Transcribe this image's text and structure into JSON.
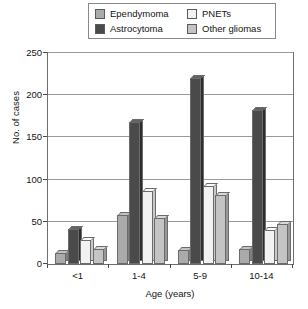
{
  "chart_data": {
    "type": "bar",
    "title": "",
    "subtitle": "",
    "xlabel": "Age (years)",
    "ylabel": "No. of cases",
    "categories": [
      "<1",
      "1-4",
      "5-9",
      "10-14"
    ],
    "series": [
      {
        "name": "Ependymoma",
        "values": [
          13,
          58,
          17,
          18
        ],
        "color": "#aaaaaa",
        "side_color": "#7e7e7e",
        "top_color": "#c2c2c2"
      },
      {
        "name": "Astrocytoma",
        "values": [
          42,
          168,
          220,
          182
        ],
        "color": "#4a4a4a",
        "side_color": "#2e2e2e",
        "top_color": "#636363"
      },
      {
        "name": "PNETs",
        "values": [
          28,
          87,
          93,
          40
        ],
        "color": "#f2f2f2",
        "side_color": "#c8c8c8",
        "top_color": "#fafafa"
      },
      {
        "name": "Other gliomas",
        "values": [
          18,
          55,
          82,
          47
        ],
        "color": "#c4c4c4",
        "side_color": "#989898",
        "top_color": "#d9d9d9"
      }
    ],
    "ylim": [
      0,
      250
    ],
    "yticks": [
      0,
      50,
      100,
      150,
      200,
      250
    ],
    "ytick_labels": [
      "0",
      "50",
      "100",
      "150",
      "200",
      "250"
    ],
    "grid": true,
    "grid_axis": "y",
    "legend_position": "top-center",
    "legend_columns": 2
  },
  "legend": {
    "entries": [
      {
        "label": "Ependymoma"
      },
      {
        "label": "PNETs"
      },
      {
        "label": "Astrocytoma"
      },
      {
        "label": "Other gliomas"
      }
    ]
  },
  "axes": {
    "y_title": "No. of cases",
    "x_title": "Age (years)"
  }
}
